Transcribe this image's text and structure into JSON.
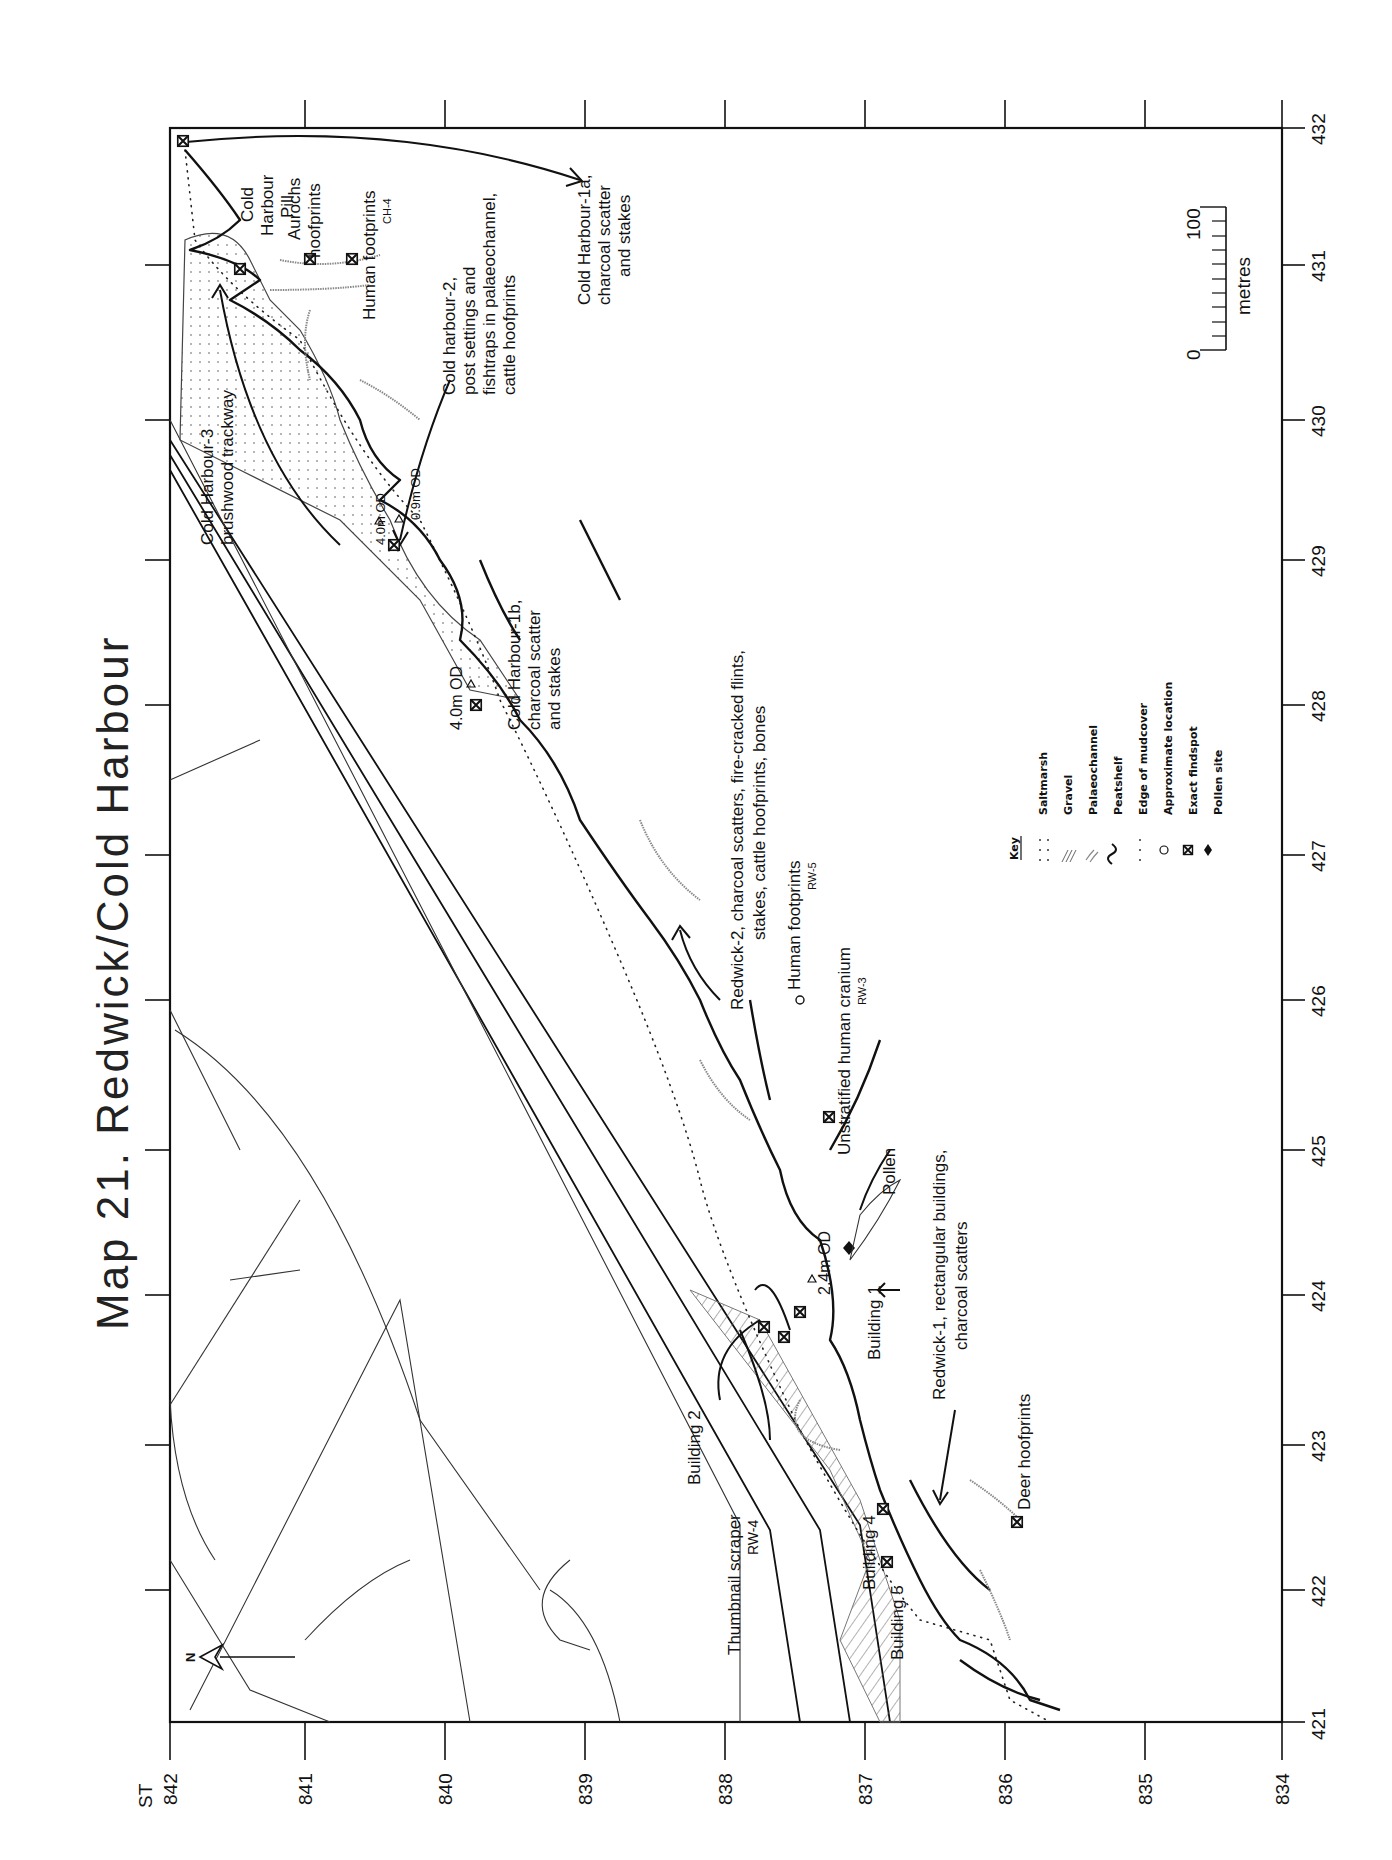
{
  "title": "Map 21.   Redwick/Cold Harbour",
  "grid_prefix": "ST",
  "northing_ticks": [
    "842",
    "841",
    "840",
    "839",
    "838",
    "837",
    "836",
    "835",
    "834"
  ],
  "easting_ticks": [
    "432",
    "431",
    "430",
    "429",
    "428",
    "427",
    "426",
    "425",
    "424",
    "423",
    "422",
    "421"
  ],
  "north_arrow": "N",
  "scale_bar": {
    "start": "0",
    "end": "100",
    "unit": "metres"
  },
  "key": {
    "heading": "Key",
    "items": [
      {
        "symbol": "dots",
        "label": "Saltmarsh"
      },
      {
        "symbol": "hatch",
        "label": "Gravel"
      },
      {
        "symbol": "double-line",
        "label": "Palaeochannel"
      },
      {
        "symbol": "wave",
        "label": "Peatshelf"
      },
      {
        "symbol": "dotted-line",
        "label": "Edge of mudcover"
      },
      {
        "symbol": "circle",
        "label": "Approximate location"
      },
      {
        "symbol": "cross-box",
        "label": "Exact findspot"
      },
      {
        "symbol": "diamond",
        "label": "Pollen site"
      }
    ]
  },
  "annotations": {
    "cold_harbour_3": [
      "Cold Harbour-3",
      "brushwood trackway"
    ],
    "cold_harbour_pill": [
      "Cold",
      "Harbour",
      "Pill"
    ],
    "aurochs": [
      "Aurochs",
      "hoofprints"
    ],
    "human_footprints_ch4": [
      "Human footprints",
      "CH-4"
    ],
    "cold_harbour_2": [
      "Cold harbour-2,",
      "post settings and",
      "fishtraps in palaeochannel,",
      "cattle hoofprints"
    ],
    "cold_harbour_1a": [
      "Cold Harbour-1a,",
      "charcoal scatter",
      "and stakes"
    ],
    "od_40_a": "4.0m OD",
    "od_09": "0.9m OD",
    "cold_harbour_1b": [
      "Cold Harbour-1b,",
      "charcoal scatter",
      "and stakes"
    ],
    "od_40_b": "4.0m OD",
    "redwick_2": [
      "Redwick-2, charcoal scatters, fire-cracked flints,",
      "stakes, cattle hoofprints, bones"
    ],
    "human_footprints_rw5": [
      "Human footprints",
      "RW-5"
    ],
    "human_cranium_rw3": [
      "Unstratified human cranium",
      "RW-3"
    ],
    "od_24": "2.4m OD",
    "pollen": "Pollen",
    "building_1": "Building 1",
    "redwick_1": [
      "Redwick-1, rectangular buildings,",
      "charcoal scatters"
    ],
    "building_2": "Building 2",
    "thumbnail_scraper": [
      "Thumbnail scraper",
      "RW-4"
    ],
    "building_4": "Building 4",
    "building_5": "Building 5",
    "deer": "Deer hoofprints"
  }
}
